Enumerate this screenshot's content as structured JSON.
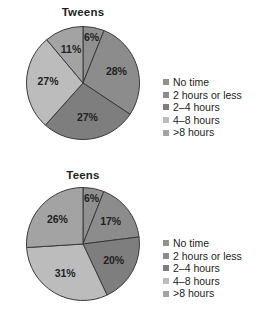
{
  "figure": {
    "background": "#ffffff",
    "text_color": "#231f20",
    "outline_color": "#3a3a3a"
  },
  "legend_labels": [
    "No time",
    "2 hours or less",
    "2–4 hours",
    "4–8 hours",
    ">8 hours"
  ],
  "palette": [
    "#8f8f8f",
    "#8a8a8a",
    "#7d7d7d",
    "#b7b7b7",
    "#a0a0a0"
  ],
  "panels": [
    {
      "id": "tweens",
      "title": "Tweens",
      "legend": {
        "items": [
          {
            "label": "No time",
            "color": "#909090"
          },
          {
            "label": "2 hours or less",
            "color": "#8c8c8c"
          },
          {
            "label": "2–4 hours",
            "color": "#7e7e7e"
          },
          {
            "label": "4–8 hours",
            "color": "#bcbcbc"
          },
          {
            "label": "&gt;8 hours",
            "color": "#a3a3a3"
          }
        ]
      }
    },
    {
      "id": "teens",
      "title": "Teens",
      "legend": {
        "items": [
          {
            "label": "No time",
            "color": "#909090"
          },
          {
            "label": "2 hours or less",
            "color": "#8c8c8c"
          },
          {
            "label": "2–4 hours",
            "color": "#7e7e7e"
          },
          {
            "label": "4–8 hours",
            "color": "#bcbcbc"
          },
          {
            "label": "&gt;8 hours",
            "color": "#a3a3a3"
          }
        ]
      }
    }
  ],
  "chart_data": [
    {
      "type": "pie",
      "title": "Tweens",
      "xlabel": "",
      "ylabel": "",
      "legend_position": "right",
      "start_angle_deg": 0,
      "direction": "clockwise",
      "categories": [
        "No time",
        "2 hours or less",
        "2–4 hours",
        "4–8 hours",
        ">8 hours"
      ],
      "values": [
        6,
        28,
        27,
        27,
        11
      ],
      "labels": [
        "6%",
        "28%",
        "27%",
        "27%",
        "11%"
      ],
      "colors": [
        "#909090",
        "#8c8c8c",
        "#7e7e7e",
        "#bcbcbc",
        "#a3a3a3"
      ],
      "units": "percent"
    },
    {
      "type": "pie",
      "title": "Teens",
      "xlabel": "",
      "ylabel": "",
      "legend_position": "right",
      "start_angle_deg": 0,
      "direction": "clockwise",
      "categories": [
        "No time",
        "2 hours or less",
        "2–4 hours",
        "4–8 hours",
        ">8 hours"
      ],
      "values": [
        6,
        17,
        20,
        31,
        26
      ],
      "labels": [
        "6%",
        "17%",
        "20%",
        "31%",
        "26%"
      ],
      "colors": [
        "#909090",
        "#8c8c8c",
        "#7e7e7e",
        "#bcbcbc",
        "#a3a3a3"
      ],
      "units": "percent"
    }
  ]
}
